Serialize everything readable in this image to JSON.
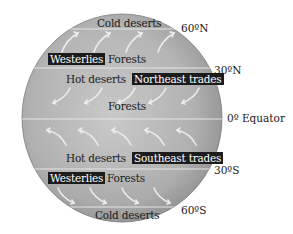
{
  "diagram": {
    "type": "global wind and climate belts",
    "colors": {
      "globe_light": "#c8c8c8",
      "globe_dark": "#8a8a8a",
      "latitude_line": "#e6e6e6",
      "label_box_bg": "#1c1c1c",
      "label_box_text": "#ffffff",
      "text": "#1a1a1a",
      "arrow": "#e8e8e8"
    },
    "latitudes": {
      "n60": "60ºN",
      "n30": "30ºN",
      "equator": "0º Equator",
      "s30": "30ºS",
      "s60": "60ºS"
    },
    "zones": {
      "north_cold": "Cold deserts",
      "north_westerlies": "Westerlies",
      "north_forests": "Forests",
      "north_hot": "Hot deserts",
      "north_trades": "Northeast trades",
      "equator_forests": "Forests",
      "south_hot": "Hot deserts",
      "south_trades": "Southeast trades",
      "south_westerlies": "Westerlies",
      "south_forests": "Forests",
      "south_cold": "Cold deserts"
    },
    "wind_arrows": {
      "westerlies_north": {
        "count": 4,
        "direction": "toward northeast"
      },
      "trades_north": {
        "count": 5,
        "direction": "toward southwest"
      },
      "trades_south": {
        "count": 5,
        "direction": "toward northwest (curving from upper-left)"
      },
      "westerlies_south": {
        "count": 4,
        "direction": "toward southeast"
      }
    }
  }
}
